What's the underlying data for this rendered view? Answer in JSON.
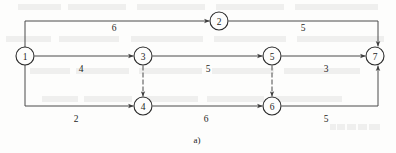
{
  "figure": {
    "caption": "a)",
    "type": "activity-on-edge network (AOE)",
    "nodes": [
      {
        "id": "1",
        "label": "1",
        "cx": 25,
        "cy": 56
      },
      {
        "id": "2",
        "label": "2",
        "cx": 219,
        "cy": 21
      },
      {
        "id": "3",
        "label": "3",
        "cx": 143,
        "cy": 56
      },
      {
        "id": "4",
        "label": "4",
        "cx": 143,
        "cy": 106
      },
      {
        "id": "5",
        "label": "5",
        "cx": 272,
        "cy": 56
      },
      {
        "id": "6",
        "label": "6",
        "cx": 272,
        "cy": 106
      },
      {
        "id": "7",
        "label": "7",
        "cx": 375,
        "cy": 56
      }
    ],
    "edges": [
      {
        "from": "1",
        "to": "2",
        "weight": "6",
        "style": "solid",
        "label_x": 114,
        "label_y": 31
      },
      {
        "from": "2",
        "to": "7",
        "weight": "5",
        "style": "solid",
        "label_x": 303,
        "label_y": 31
      },
      {
        "from": "1",
        "to": "3",
        "weight": "4",
        "style": "solid",
        "label_x": 81,
        "label_y": 72
      },
      {
        "from": "3",
        "to": "5",
        "weight": "5",
        "style": "solid",
        "label_x": 208,
        "label_y": 72
      },
      {
        "from": "5",
        "to": "7",
        "weight": "3",
        "style": "solid",
        "label_x": 326,
        "label_y": 72
      },
      {
        "from": "1",
        "to": "4",
        "weight": "2",
        "style": "solid",
        "label_x": 76,
        "label_y": 122
      },
      {
        "from": "4",
        "to": "6",
        "weight": "6",
        "style": "solid",
        "label_x": 206,
        "label_y": 122
      },
      {
        "from": "6",
        "to": "7",
        "weight": "5",
        "style": "solid",
        "label_x": 326,
        "label_y": 122
      },
      {
        "from": "3",
        "to": "4",
        "weight": "",
        "style": "dashed",
        "label_x": 0,
        "label_y": 0
      },
      {
        "from": "5",
        "to": "6",
        "weight": "",
        "style": "dashed",
        "label_x": 0,
        "label_y": 0
      }
    ],
    "colors": {
      "stroke": "#4a4a4a",
      "node_stroke": "#2b2b2b",
      "text": "#1d1d1d",
      "background": "#fdfdfc"
    }
  }
}
